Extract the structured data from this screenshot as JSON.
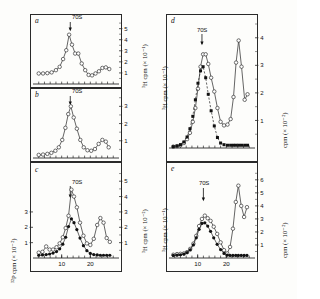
{
  "figure": {
    "caption_marker": "70S",
    "panels": [
      "a",
      "b",
      "c",
      "d",
      "e"
    ]
  },
  "labels": {
    "panel_a": "a",
    "panel_b": "b",
    "panel_c": "c",
    "panel_d": "d",
    "panel_e": "e",
    "marker_a": "70S",
    "marker_b": "70S",
    "marker_c": "70S",
    "marker_d": "70S",
    "marker_e": "70S",
    "yaxis_right_a": "³H cpm (× 10⁻¹)",
    "yaxis_right_b": "³H cpm (× 10⁻²)",
    "yaxis_right_c": "³H cpm (× 10⁻²)",
    "yaxis_left_c": "³²P cpm (× 10⁻²)",
    "yaxis_left_d": "³H cpm (× 10⁻¹)",
    "yaxis_right_d": "cpm (× 10⁻²)",
    "yaxis_left_e": "³H cpm (× 10⁻¹)",
    "yaxis_right_e": "cpm (× 10⁻²)"
  },
  "colors": {
    "axis": "#2a2a2a",
    "line": "#333333",
    "open_marker_fill": "#ffffff",
    "filled_marker": "#111111",
    "background": "#fdfdfb"
  },
  "chart_data": [
    {
      "type": "line",
      "panel": "a",
      "title": "a",
      "xlabel": "",
      "ylabel": "³H cpm (× 10⁻¹)",
      "xlim": [
        0,
        30
      ],
      "ylim": [
        0,
        5.6
      ],
      "yticks": [
        1,
        2,
        3,
        4,
        5
      ],
      "xticks": [],
      "grid": false,
      "marker_arrow_x": 13,
      "marker_arrow_label": "70S",
      "series": [
        {
          "name": "³H",
          "marker": "open-circle",
          "linestyle": "solid",
          "x": [
            2.0,
            3.5,
            5.0,
            6.5,
            8.0,
            9.3,
            10.5,
            11.6,
            12.6,
            13.6,
            14.7,
            15.8,
            17.0,
            18.2,
            19.4,
            20.6,
            21.8,
            23.0,
            24.2,
            25.4,
            26.6
          ],
          "y": [
            0.95,
            0.95,
            0.98,
            1.05,
            1.25,
            1.55,
            2.25,
            3.05,
            4.45,
            3.55,
            2.75,
            2.75,
            1.85,
            1.25,
            0.82,
            0.78,
            0.95,
            1.15,
            1.45,
            1.5,
            1.35
          ]
        }
      ]
    },
    {
      "type": "line",
      "panel": "b",
      "title": "b",
      "xlabel": "",
      "ylabel": "³H cpm (× 10⁻²)",
      "xlim": [
        0,
        30
      ],
      "ylim": [
        0,
        3.6
      ],
      "yticks": [
        1,
        2,
        3
      ],
      "xticks": [],
      "grid": false,
      "marker_arrow_x": 13,
      "marker_arrow_label": "70S",
      "series": [
        {
          "name": "³H",
          "marker": "open-circle",
          "linestyle": "solid",
          "x": [
            2.0,
            3.5,
            5.0,
            6.4,
            7.8,
            9.0,
            10.2,
            11.3,
            12.3,
            13.2,
            14.2,
            15.3,
            16.5,
            17.7,
            19.0,
            20.3,
            21.6,
            22.9,
            24.2,
            25.4,
            26.4
          ],
          "y": [
            0.18,
            0.2,
            0.24,
            0.3,
            0.42,
            0.62,
            1.05,
            1.75,
            2.55,
            3.0,
            2.35,
            1.7,
            1.05,
            0.62,
            0.45,
            0.42,
            0.52,
            0.82,
            1.05,
            0.95,
            0.62
          ]
        }
      ]
    },
    {
      "type": "line",
      "panel": "c",
      "title": "c",
      "xlabel": "",
      "ylabel": "³²P cpm (× 10⁻²)",
      "ylabel_right": "³H cpm (× 10⁻²)",
      "xlim": [
        0,
        30
      ],
      "ylim": [
        0,
        5.6
      ],
      "yticks_left": [
        1,
        2,
        3
      ],
      "yticks_right": [
        1,
        2,
        3,
        4,
        5
      ],
      "xticks": [
        10,
        20
      ],
      "grid": false,
      "marker_arrow_x": 13,
      "marker_arrow_label": "70S",
      "series": [
        {
          "name": "³H",
          "marker": "open-circle",
          "linestyle": "solid",
          "x": [
            2.0,
            3.3,
            4.6,
            5.8,
            7.0,
            8.2,
            9.3,
            10.4,
            11.4,
            12.4,
            13.4,
            14.3,
            15.3,
            16.4,
            17.6,
            18.8,
            20.0,
            21.2,
            22.4,
            23.5,
            24.6,
            25.7,
            26.8
          ],
          "y": [
            0.35,
            0.4,
            0.75,
            0.55,
            0.55,
            0.7,
            0.95,
            1.35,
            1.95,
            2.75,
            4.45,
            4.0,
            3.3,
            2.3,
            1.45,
            0.95,
            0.85,
            1.25,
            2.15,
            2.6,
            2.3,
            1.3,
            1.05
          ]
        },
        {
          "name": "³²P",
          "marker": "filled-circle",
          "linestyle": "solid",
          "x": [
            2.0,
            3.3,
            4.6,
            5.8,
            7.0,
            8.2,
            9.3,
            10.4,
            11.4,
            12.4,
            13.4,
            14.3,
            15.3,
            16.4,
            17.6,
            18.8,
            20.0,
            21.2,
            22.4,
            23.5,
            24.6,
            25.7,
            26.8
          ],
          "y": [
            0.18,
            0.2,
            0.22,
            0.26,
            0.32,
            0.42,
            0.6,
            0.9,
            1.35,
            2.05,
            2.55,
            2.3,
            1.85,
            1.3,
            0.8,
            0.48,
            0.3,
            0.22,
            0.2,
            0.18,
            0.18,
            0.18,
            0.18
          ]
        }
      ]
    },
    {
      "type": "line",
      "panel": "d",
      "title": "d",
      "xlabel": "",
      "ylabel": "³H cpm (× 10⁻¹)",
      "ylabel_right": "cpm (× 10⁻²)",
      "xlim": [
        0,
        30
      ],
      "ylim": [
        0,
        4.5
      ],
      "yticks_right": [
        1,
        2,
        3,
        4
      ],
      "xticks": [],
      "grid": false,
      "marker_arrow_x": 11.5,
      "marker_arrow_label": "70S",
      "series": [
        {
          "name": "³H",
          "marker": "open-circle",
          "linestyle": "solid",
          "x": [
            1.5,
            2.8,
            4.0,
            5.2,
            6.3,
            7.3,
            8.3,
            9.2,
            10.1,
            11.0,
            11.9,
            12.8,
            13.7,
            14.7,
            15.8,
            16.9,
            18.0,
            19.2,
            20.4,
            21.5,
            22.5,
            23.4,
            24.3,
            25.3,
            26.4,
            27.4
          ],
          "y": [
            0.05,
            0.07,
            0.1,
            0.18,
            0.32,
            0.55,
            0.95,
            1.45,
            2.15,
            2.95,
            3.4,
            3.4,
            3.05,
            2.55,
            2.05,
            1.45,
            0.95,
            0.82,
            0.85,
            1.05,
            1.85,
            3.1,
            3.9,
            2.95,
            1.75,
            1.95
          ]
        },
        {
          "name": "³²P",
          "marker": "filled-square",
          "linestyle": "dashed",
          "x": [
            1.5,
            2.8,
            4.0,
            5.2,
            6.3,
            7.3,
            8.3,
            9.2,
            10.1,
            11.0,
            11.9,
            12.8,
            13.7,
            14.7,
            15.8,
            16.9,
            18.0,
            19.2,
            20.4,
            21.5,
            22.5,
            23.4,
            24.3,
            25.3,
            26.4,
            27.4
          ],
          "y": [
            0.05,
            0.07,
            0.12,
            0.22,
            0.4,
            0.7,
            1.15,
            1.75,
            2.35,
            2.8,
            2.95,
            2.55,
            1.95,
            1.35,
            0.8,
            0.38,
            0.18,
            0.12,
            0.1,
            0.1,
            0.1,
            0.1,
            0.1,
            0.1,
            0.1,
            0.1
          ]
        }
      ]
    },
    {
      "type": "line",
      "panel": "e",
      "title": "e",
      "xlabel": "",
      "ylabel": "³H cpm (× 10⁻¹)",
      "ylabel_right": "cpm (× 10⁻²)",
      "xlim": [
        0,
        30
      ],
      "ylim": [
        0,
        6.6
      ],
      "yticks_right": [
        1,
        2,
        3,
        4,
        5,
        6
      ],
      "xticks": [
        10,
        20
      ],
      "grid": false,
      "marker_arrow_x": 12,
      "marker_arrow_label": "70S",
      "series": [
        {
          "name": "³H",
          "marker": "open-circle",
          "linestyle": "solid",
          "x": [
            1.5,
            2.8,
            4.0,
            5.2,
            6.3,
            7.4,
            8.5,
            9.5,
            10.5,
            11.5,
            12.5,
            13.5,
            14.5,
            15.6,
            16.8,
            18.0,
            19.2,
            20.3,
            21.3,
            22.3,
            23.3,
            24.2,
            25.2,
            26.2,
            27.2
          ],
          "y": [
            0.25,
            0.3,
            0.32,
            0.35,
            0.45,
            0.7,
            1.1,
            1.7,
            2.45,
            3.0,
            3.25,
            3.05,
            2.85,
            2.4,
            1.85,
            1.2,
            0.6,
            0.35,
            0.85,
            2.25,
            4.3,
            5.55,
            4.0,
            3.15,
            3.9
          ]
        },
        {
          "name": "³²P",
          "marker": "filled-circle",
          "linestyle": "solid",
          "x": [
            1.5,
            2.8,
            4.0,
            5.2,
            6.3,
            7.4,
            8.5,
            9.5,
            10.5,
            11.5,
            12.5,
            13.5,
            14.5,
            15.6,
            16.8,
            18.0,
            19.2,
            20.3,
            21.3,
            22.3,
            23.3,
            24.2,
            25.2,
            26.2,
            27.2
          ],
          "y": [
            0.2,
            0.22,
            0.25,
            0.3,
            0.42,
            0.62,
            1.0,
            1.55,
            2.2,
            2.65,
            2.7,
            2.45,
            2.05,
            1.55,
            1.05,
            0.65,
            0.35,
            0.22,
            0.2,
            0.2,
            0.2,
            0.2,
            0.2,
            0.2,
            0.2
          ]
        }
      ]
    }
  ]
}
